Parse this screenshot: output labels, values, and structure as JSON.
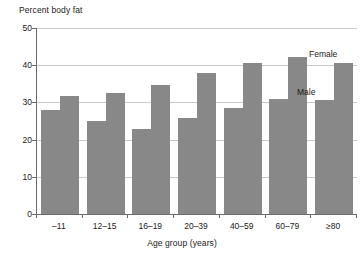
{
  "chart_data": {
    "type": "bar",
    "title": "Percent body fat",
    "xlabel": "Age group (years)",
    "ylabel": "",
    "ylim": [
      0,
      50
    ],
    "yticks": [
      0,
      10,
      20,
      30,
      40,
      50
    ],
    "ytick_labels": [
      "0",
      "10",
      "20",
      "30",
      "40",
      "50"
    ],
    "grid": true,
    "legend": "annotated-in-plot",
    "categories": [
      "–11",
      "12–15",
      "16–19",
      "20–39",
      "40–59",
      "60–79",
      "≥80"
    ],
    "series": [
      {
        "name": "Male",
        "color": "#888888",
        "values": [
          28.0,
          25.0,
          22.8,
          25.9,
          28.5,
          30.8,
          30.6
        ]
      },
      {
        "name": "Female",
        "color": "#888888",
        "values": [
          31.8,
          32.4,
          34.8,
          37.8,
          40.5,
          42.2,
          40.5
        ]
      }
    ],
    "annotations": [
      {
        "text": "Female",
        "series": "Female"
      },
      {
        "text": "Male",
        "series": "Male"
      }
    ]
  },
  "axis": {
    "color": "#6b6b6b",
    "gridline_color": "#c9c9c9"
  }
}
